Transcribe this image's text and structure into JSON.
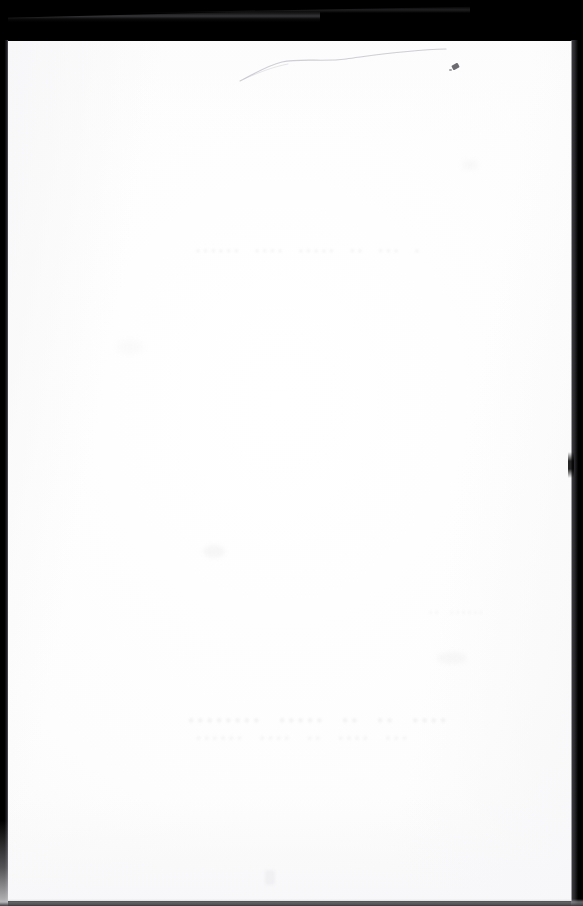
{
  "document": {
    "kind": "scanned-page",
    "description": "Scanned blank leaf of a bound document on a black scanner bed",
    "page_surface": "blank",
    "width_px": 583,
    "height_px": 906
  },
  "colors": {
    "scanner_background": "#000000",
    "paper": "#ffffff",
    "paper_shadow": "#f4f4f6",
    "edge_highlight": "#55555a",
    "ink_speck": "#4a4a50",
    "ghost_text": "#9696a0"
  },
  "regions": {
    "top_band_label": "scanner background, top",
    "left_band_label": "scanner background, left",
    "right_band_label": "scanner background, right",
    "bottom_band_label": "scanner background, bottom",
    "paper_label": "blank page"
  },
  "artifacts": {
    "crease_label": "paper crease",
    "speck_label": "ink speck",
    "lifted_corner_label": "lifted page corner",
    "notch_label": "page edge notch",
    "smudge_label": "paper smudge"
  },
  "showthrough": {
    "note": "Illegible ink bleed-through from the reverse side of the leaf",
    "upper_line": "• •••  ••  •••••  •••• ••••••",
    "middle_line": "••••••  ••",
    "lower_line": "••••  ••  ••  •••••  ••••••••",
    "lower_line_2": "•••  ••••  ••  ••••  ••••••"
  }
}
